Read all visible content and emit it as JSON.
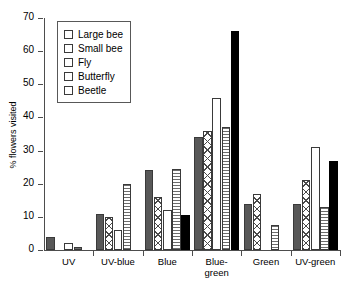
{
  "chart_data": {
    "type": "bar",
    "title": "",
    "xlabel": "",
    "ylabel": "% flowers visited",
    "ylim": [
      0,
      70
    ],
    "ytick_labels": [
      "0",
      "10",
      "20",
      "30",
      "40",
      "50",
      "60",
      "70"
    ],
    "ytick_values": [
      0,
      10,
      20,
      30,
      40,
      50,
      60,
      70
    ],
    "grid": false,
    "legend_position": "upper-left-inside",
    "categories": [
      "UV",
      "UV-blue",
      "Blue",
      "Blue-green",
      "Green",
      "UV-green"
    ],
    "series": [
      {
        "name": "Large bee",
        "color": "#585858",
        "pattern": "solid-dark-gray",
        "values": [
          4,
          11,
          24,
          34,
          14,
          14
        ]
      },
      {
        "name": "Small bee",
        "color": "#4a4a4a",
        "pattern": "crosshatch",
        "values": [
          0,
          10,
          16,
          36,
          17,
          21
        ]
      },
      {
        "name": "Fly",
        "color": "#ffffff",
        "pattern": "white",
        "values": [
          2,
          6,
          12,
          46,
          0,
          31
        ]
      },
      {
        "name": "Butterfly",
        "color": "#6d6d6d",
        "pattern": "horizontal-lines",
        "values": [
          1,
          20,
          24.5,
          37,
          7.5,
          13
        ]
      },
      {
        "name": "Beetle",
        "color": "#000000",
        "pattern": "solid-black",
        "values": [
          0,
          0,
          10.7,
          66,
          0,
          27
        ]
      }
    ]
  },
  "legend": {
    "items": [
      {
        "label": "Large bee"
      },
      {
        "label": "Small bee"
      },
      {
        "label": "Fly"
      },
      {
        "label": "Butterfly"
      },
      {
        "label": "Beetle"
      }
    ]
  },
  "axis": {
    "y_title": "% flowers visited"
  }
}
